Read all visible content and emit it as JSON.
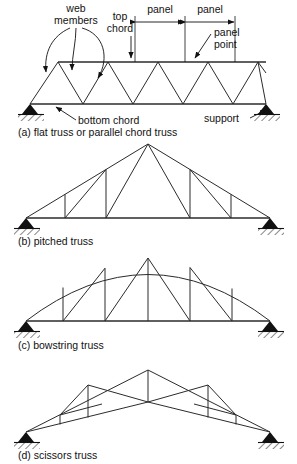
{
  "figure": {
    "background": "#ffffff",
    "line_color": "#2b2b2b"
  },
  "annotations": {
    "web_members": {
      "line1": "web",
      "line2": "members"
    },
    "top_chord": {
      "line1": "top",
      "line2": "chord"
    },
    "panel_left": "panel",
    "panel_right": "panel",
    "panel_point": {
      "line1": "panel",
      "line2": "point"
    },
    "bottom_chord": "bottom chord",
    "support": "support"
  },
  "captions": {
    "a": "(a) flat truss or parallel chord truss",
    "b": "(b) pitched truss",
    "c": "(c) bowstring truss",
    "d": "(d) scissors truss"
  },
  "diagrams": [
    {
      "id": "flat-truss",
      "label": "(a) flat truss or parallel chord truss",
      "type": "flat parallel chord truss",
      "top_chord_y": 62,
      "bottom_chord_y": 104,
      "left_support_x": 30,
      "right_support_x": 266,
      "top_nodes_x": [
        58,
        108,
        158,
        208,
        258
      ],
      "bottom_nodes_x": [
        33,
        83,
        133,
        183,
        233,
        266
      ],
      "panels": 2
    },
    {
      "id": "pitched-truss",
      "label": "(b) pitched truss",
      "type": "pitched (fink) truss",
      "apex_x": 148,
      "apex_y": 144,
      "bottom_chord_y": 218,
      "left_support_x": 26,
      "right_support_x": 270,
      "vertical_bases_x": [
        65,
        106,
        190,
        231
      ]
    },
    {
      "id": "bowstring-truss",
      "label": "(c) bowstring truss",
      "type": "bowstring truss",
      "crown_y": 258,
      "bottom_chord_y": 321,
      "left_support_x": 26,
      "right_support_x": 270,
      "vertical_bases_x": [
        63,
        105,
        148,
        190,
        232
      ]
    },
    {
      "id": "scissors-truss",
      "label": "(d) scissors truss",
      "type": "scissors truss",
      "apex_x": 148,
      "apex_y": 370,
      "left_support_x": 26,
      "right_support_x": 270,
      "support_y": 432,
      "center_bottom_y": 402
    }
  ]
}
